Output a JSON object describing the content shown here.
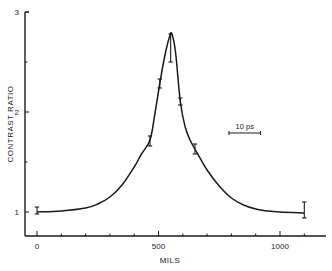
{
  "chart_data": {
    "type": "line",
    "title": "",
    "xlabel": "MILS",
    "ylabel": "CONTRAST RATIO",
    "xlim": [
      -50,
      1200
    ],
    "ylim": [
      0.75,
      3
    ],
    "x_ticks": [
      0,
      500,
      1000
    ],
    "x_tick_labels": [
      "0",
      "500",
      "1000"
    ],
    "x_minor_step": 100,
    "y_ticks": [
      1,
      2,
      3
    ],
    "y_tick_labels": [
      "1",
      "2",
      "3"
    ],
    "y_minor_step": 0.5,
    "grid": false,
    "legend": null,
    "series": [
      {
        "name": "contrast ratio curve",
        "x": [
          0,
          100,
          200,
          250,
          300,
          350,
          400,
          430,
          465,
          485,
          505,
          525,
          545,
          555,
          570,
          590,
          610,
          630,
          650,
          700,
          750,
          800,
          850,
          900,
          950,
          1000,
          1100
        ],
        "y": [
          1.0,
          1.01,
          1.04,
          1.08,
          1.15,
          1.27,
          1.45,
          1.58,
          1.72,
          1.98,
          2.28,
          2.55,
          2.75,
          2.78,
          2.6,
          2.1,
          1.85,
          1.72,
          1.63,
          1.42,
          1.26,
          1.14,
          1.07,
          1.03,
          1.01,
          1.0,
          0.99
        ]
      }
    ],
    "error_bars": [
      {
        "x": 0,
        "y": 1.0,
        "low": 0.98,
        "high": 1.05
      },
      {
        "x": 465,
        "y": 1.72,
        "low": 1.66,
        "high": 1.76
      },
      {
        "x": 505,
        "y": 2.28,
        "low": 2.24,
        "high": 2.33
      },
      {
        "x": 550,
        "y": 2.76,
        "low": 2.5,
        "high": 2.78
      },
      {
        "x": 590,
        "y": 2.1,
        "low": 2.07,
        "high": 2.14
      },
      {
        "x": 650,
        "y": 1.63,
        "low": 1.58,
        "high": 1.68
      },
      {
        "x": 1100,
        "y": 0.99,
        "low": 0.94,
        "high": 1.1
      }
    ],
    "annotations": [
      {
        "text": "10 ps",
        "type": "scale-bar",
        "x_start": 790,
        "x_end": 920,
        "y": 1.83
      }
    ]
  },
  "labels": {
    "xlabel": "MILS",
    "ylabel": "CONTRAST RATIO",
    "scale_bar": "10 ps"
  }
}
